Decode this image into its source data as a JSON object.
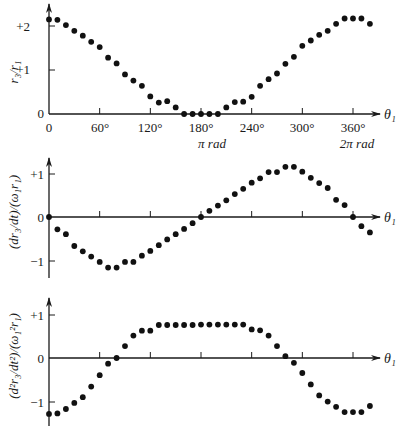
{
  "chart_data": [
    {
      "type": "scatter",
      "title": "",
      "xlabel": "θ₁",
      "ylabel": "r₃/r₁",
      "x_ticks": [
        "0",
        "60°",
        "120°",
        "180°",
        "240°",
        "300°",
        "360°"
      ],
      "x_tick_values": [
        0,
        60,
        120,
        180,
        240,
        300,
        360
      ],
      "x_secondary_labels": [
        {
          "x": 180,
          "label": "π rad"
        },
        {
          "x": 360,
          "label": "2π rad"
        }
      ],
      "y_ticks": [
        "0",
        "+1",
        "+2"
      ],
      "y_tick_values": [
        0,
        1,
        2
      ],
      "ylim": [
        0,
        2.5
      ],
      "xlim": [
        0,
        380
      ],
      "grid": false,
      "x": [
        0,
        10,
        20,
        30,
        40,
        50,
        60,
        70,
        80,
        90,
        100,
        110,
        120,
        130,
        140,
        150,
        160,
        170,
        180,
        190,
        200,
        210,
        220,
        230,
        240,
        250,
        260,
        270,
        280,
        290,
        300,
        310,
        320,
        330,
        340,
        350,
        360,
        370,
        380
      ],
      "values": [
        2.15,
        2.14,
        2.02,
        1.89,
        1.78,
        1.64,
        1.52,
        1.28,
        1.15,
        0.9,
        0.76,
        0.64,
        0.4,
        0.26,
        0.29,
        0.15,
        0,
        0,
        0,
        0,
        0,
        0.15,
        0.27,
        0.28,
        0.39,
        0.64,
        0.79,
        0.92,
        1.14,
        1.3,
        1.55,
        1.67,
        1.8,
        1.89,
        2.05,
        2.17,
        2.17,
        2.17,
        2.05
      ]
    },
    {
      "type": "scatter",
      "title": "",
      "xlabel": "θ₁",
      "ylabel": "(dr₃/dt)/(ω₁r₁)",
      "x_tick_values": [
        60,
        120,
        180,
        240,
        300,
        360
      ],
      "y_ticks": [
        "−1",
        "0",
        "+1"
      ],
      "y_tick_values": [
        -1,
        0,
        1
      ],
      "ylim": [
        -1.3,
        1.5
      ],
      "xlim": [
        0,
        380
      ],
      "grid": false,
      "x": [
        0,
        10,
        20,
        30,
        40,
        50,
        60,
        70,
        80,
        90,
        100,
        110,
        120,
        130,
        140,
        150,
        160,
        170,
        180,
        190,
        200,
        210,
        220,
        230,
        240,
        250,
        260,
        270,
        280,
        290,
        300,
        310,
        320,
        330,
        340,
        350,
        360,
        370,
        380
      ],
      "values": [
        0,
        -0.28,
        -0.39,
        -0.66,
        -0.78,
        -0.9,
        -1.02,
        -1.15,
        -1.15,
        -1.02,
        -1.02,
        -0.88,
        -0.77,
        -0.64,
        -0.51,
        -0.39,
        -0.27,
        -0.14,
        0,
        0.14,
        0.26,
        0.38,
        0.52,
        0.64,
        0.78,
        0.88,
        1.02,
        1.02,
        1.14,
        1.14,
        1.03,
        0.89,
        0.77,
        0.66,
        0.39,
        0.27,
        0,
        -0.21,
        -0.35
      ]
    },
    {
      "type": "scatter",
      "title": "",
      "xlabel": "θ₁",
      "ylabel": "(d²r₃/dt²)/(ω₁²r₁)",
      "x_tick_values": [
        60,
        120,
        180,
        240,
        300,
        360
      ],
      "y_ticks": [
        "−1",
        "0",
        "+1"
      ],
      "y_tick_values": [
        -1,
        0,
        1
      ],
      "ylim": [
        -1.5,
        1.4
      ],
      "xlim": [
        0,
        380
      ],
      "grid": false,
      "x": [
        0,
        10,
        20,
        30,
        40,
        50,
        60,
        70,
        80,
        90,
        100,
        110,
        120,
        130,
        140,
        150,
        160,
        170,
        180,
        190,
        200,
        210,
        220,
        230,
        240,
        250,
        260,
        270,
        280,
        290,
        300,
        310,
        320,
        330,
        340,
        350,
        360,
        370,
        380
      ],
      "values": [
        -1.27,
        -1.26,
        -1.16,
        -1.02,
        -0.89,
        -0.65,
        -0.39,
        -0.13,
        0,
        0.27,
        0.51,
        0.62,
        0.62,
        0.75,
        0.75,
        0.75,
        0.75,
        0.75,
        0.76,
        0.76,
        0.76,
        0.76,
        0.76,
        0.76,
        0.65,
        0.63,
        0.51,
        0.27,
        0.04,
        -0.11,
        -0.34,
        -0.6,
        -0.85,
        -0.99,
        -1.11,
        -1.23,
        -1.23,
        -1.23,
        -1.09
      ]
    }
  ],
  "labels": {
    "x_axis_symbol": "θ₁",
    "top": {
      "ylabel": "r₃/r₁",
      "y_ticks": [
        "+2",
        "+1",
        "0"
      ],
      "x_ticks": [
        "0",
        "60°",
        "120°",
        "180°",
        "240°",
        "300°",
        "360°"
      ],
      "pi_rad": "π rad",
      "two_pi_rad": "2π rad"
    },
    "middle": {
      "ylabel": "(dr₃/dt)/(ω₁r₁)",
      "y_ticks": [
        "+1",
        "0",
        "−1"
      ]
    },
    "bottom": {
      "ylabel": "(d²r₃/dt²)/(ω₁²r₁)",
      "y_ticks": [
        "+1",
        "0",
        "−1"
      ]
    }
  }
}
